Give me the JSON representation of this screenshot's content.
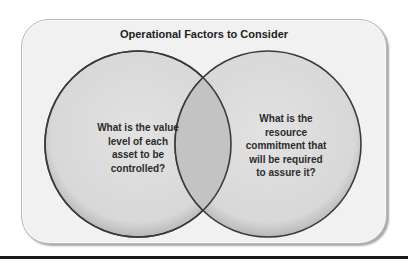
{
  "diagram": {
    "type": "venn",
    "title": "Operational Factors to Consider",
    "circles": [
      {
        "id": "left",
        "label_lines": [
          "What is the value",
          "level of each",
          "asset to be",
          "controlled?"
        ]
      },
      {
        "id": "right",
        "label_lines": [
          "What is the",
          "resource",
          "commitment that",
          "will be required",
          "to assure it?"
        ]
      }
    ],
    "colors": {
      "card_fill": "#f1f1f1",
      "circle_fill": "#dcdcdc",
      "overlap_fill": "#c4c4c4",
      "circle_stroke": "#3a3a3a",
      "rule": "#1a1a1a"
    }
  }
}
